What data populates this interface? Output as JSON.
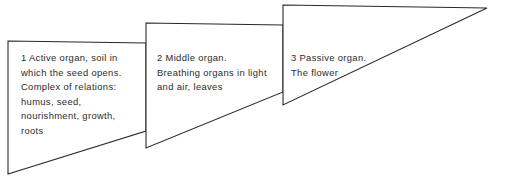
{
  "diagram": {
    "organs": [
      {
        "number": "1",
        "lines": [
          "1  Active organ, soil in",
          "which the seed opens.",
          "Complex of relations:",
          "humus, seed,",
          "nourishment, growth,",
          "roots"
        ]
      },
      {
        "number": "2",
        "lines": [
          "2  Middle organ.",
          "Breathing organs in light",
          "and air, leaves"
        ]
      },
      {
        "number": "3",
        "lines": [
          "3  Passive organ.",
          "The flower"
        ]
      }
    ],
    "colors": {
      "stroke": "#2a2a2a",
      "text": "#2b2b2b",
      "background": "#ffffff"
    }
  }
}
